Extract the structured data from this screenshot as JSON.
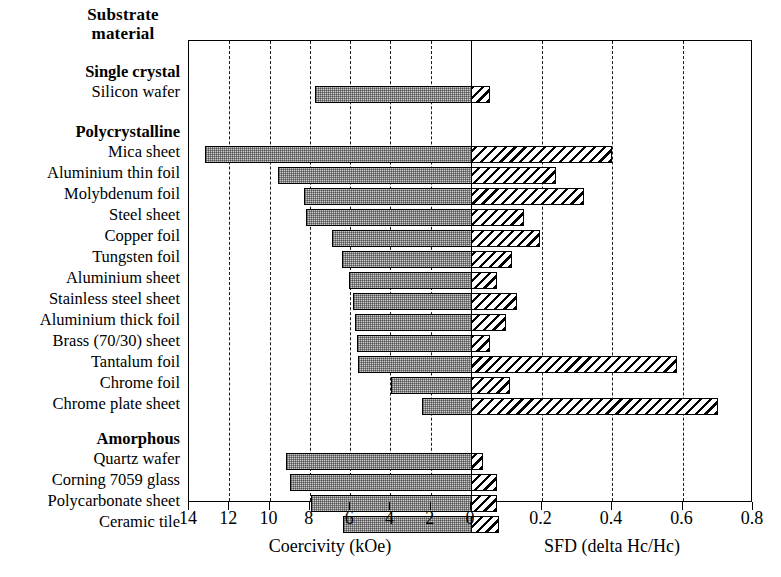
{
  "header": {
    "line1": "Substrate",
    "line2": "material"
  },
  "axis": {
    "left_title": "Coercivity (kOe)",
    "right_title": "SFD (delta Hc/Hc)",
    "left_ticks": [
      "14",
      "12",
      "10",
      "8",
      "6",
      "4",
      "2",
      "0"
    ],
    "right_ticks": [
      "0.2",
      "0.4",
      "0.6",
      "0.8"
    ]
  },
  "groups": [
    {
      "name": "Single crystal"
    },
    {
      "name": "Polycrystalline"
    },
    {
      "name": "Amorphous"
    }
  ],
  "chart_data": {
    "type": "bar",
    "orientation": "horizontal",
    "title": "Substrate material",
    "xlabel_left": "Coercivity (kOe)",
    "xlabel_right": "SFD (delta Hc/Hc)",
    "ylabel": "Substrate material",
    "grid": "dashed vertical gridlines at every labelled tick",
    "legend": "none",
    "xlim_left": [
      14,
      0
    ],
    "xlim_right": [
      0,
      0.8
    ],
    "left_tick_values": [
      14,
      12,
      10,
      8,
      6,
      4,
      2,
      0
    ],
    "right_tick_values": [
      0.2,
      0.4,
      0.6,
      0.8
    ],
    "series": [
      {
        "name": "Coercivity (kOe)",
        "direction": "left",
        "fill": "stippled-grey"
      },
      {
        "name": "SFD (delta Hc/Hc)",
        "direction": "right",
        "fill": "diagonal-hatch"
      }
    ],
    "categories": [
      "Silicon wafer",
      "Mica sheet",
      "Aluminium thin foil",
      "Molybdenum foil",
      "Steel sheet",
      "Copper foil",
      "Tungsten foil",
      "Aluminium sheet",
      "Stainless steel sheet",
      "Aluminium thick foil",
      "Brass (70/30) sheet",
      "Tantalum foil",
      "Chrome foil",
      "Chrome plate sheet",
      "Quartz wafer",
      "Corning 7059 glass",
      "Polycarbonate sheet",
      "Ceramic tile"
    ],
    "coercivity_kOe": [
      7.75,
      13.2,
      9.6,
      8.3,
      8.2,
      6.9,
      6.4,
      6.05,
      5.85,
      5.75,
      5.65,
      5.6,
      3.95,
      2.45,
      9.2,
      9.0,
      7.95,
      6.35
    ],
    "sfd": [
      0.055,
      0.4,
      0.24,
      0.32,
      0.15,
      0.195,
      0.115,
      0.075,
      0.13,
      0.1,
      0.055,
      0.585,
      0.11,
      0.7,
      0.035,
      0.075,
      0.075,
      0.08
    ],
    "group_membership": {
      "Single crystal": [
        "Silicon wafer"
      ],
      "Polycrystalline": [
        "Mica sheet",
        "Aluminium thin foil",
        "Molybdenum foil",
        "Steel sheet",
        "Copper foil",
        "Tungsten foil",
        "Aluminium sheet",
        "Stainless steel sheet",
        "Aluminium thick foil",
        "Brass (70/30) sheet",
        "Tantalum foil",
        "Chrome foil",
        "Chrome plate sheet"
      ],
      "Amorphous": [
        "Quartz wafer",
        "Corning 7059 glass",
        "Polycarbonate sheet",
        "Ceramic tile"
      ]
    }
  },
  "rows": [
    {
      "label": "Single crystal",
      "group": true,
      "top": 25
    },
    {
      "label": "Silicon wafer",
      "group": false,
      "top": 45,
      "coercivity_kOe": 7.75,
      "sfd": 0.055
    },
    {
      "label": "Polycrystalline",
      "group": true,
      "top": 85
    },
    {
      "label": "Mica sheet",
      "group": false,
      "top": 105,
      "coercivity_kOe": 13.2,
      "sfd": 0.4
    },
    {
      "label": "Aluminium thin foil",
      "group": false,
      "top": 126,
      "coercivity_kOe": 9.6,
      "sfd": 0.24
    },
    {
      "label": "Molybdenum foil",
      "group": false,
      "top": 147,
      "coercivity_kOe": 8.3,
      "sfd": 0.32
    },
    {
      "label": "Steel sheet",
      "group": false,
      "top": 168,
      "coercivity_kOe": 8.2,
      "sfd": 0.15
    },
    {
      "label": "Copper foil",
      "group": false,
      "top": 189,
      "coercivity_kOe": 6.9,
      "sfd": 0.195
    },
    {
      "label": "Tungsten foil",
      "group": false,
      "top": 210,
      "coercivity_kOe": 6.4,
      "sfd": 0.115
    },
    {
      "label": "Aluminium sheet",
      "group": false,
      "top": 231,
      "coercivity_kOe": 6.05,
      "sfd": 0.075
    },
    {
      "label": "Stainless steel sheet",
      "group": false,
      "top": 252,
      "coercivity_kOe": 5.85,
      "sfd": 0.13
    },
    {
      "label": "Aluminium thick foil",
      "group": false,
      "top": 273,
      "coercivity_kOe": 5.75,
      "sfd": 0.1
    },
    {
      "label": "Brass (70/30) sheet",
      "group": false,
      "top": 294,
      "coercivity_kOe": 5.65,
      "sfd": 0.055
    },
    {
      "label": "Tantalum foil",
      "group": false,
      "top": 315,
      "coercivity_kOe": 5.6,
      "sfd": 0.585
    },
    {
      "label": "Chrome foil",
      "group": false,
      "top": 336,
      "coercivity_kOe": 3.95,
      "sfd": 0.11
    },
    {
      "label": "Chrome plate sheet",
      "group": false,
      "top": 357,
      "coercivity_kOe": 2.45,
      "sfd": 0.7
    },
    {
      "label": "Amorphous",
      "group": true,
      "top": 392
    },
    {
      "label": "Quartz wafer",
      "group": false,
      "top": 412,
      "coercivity_kOe": 9.2,
      "sfd": 0.035
    },
    {
      "label": "Corning 7059 glass",
      "group": false,
      "top": 433,
      "coercivity_kOe": 9.0,
      "sfd": 0.075
    },
    {
      "label": "Polycarbonate sheet",
      "group": false,
      "top": 454,
      "coercivity_kOe": 7.95,
      "sfd": 0.075
    },
    {
      "label": "Ceramic tile",
      "group": false,
      "top": 475,
      "coercivity_kOe": 6.35,
      "sfd": 0.08
    }
  ]
}
